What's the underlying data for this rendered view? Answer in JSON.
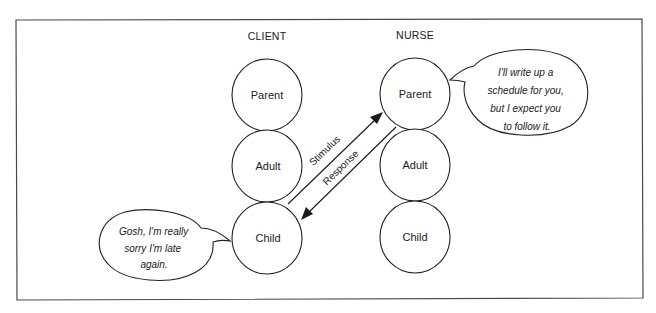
{
  "diagram": {
    "type": "transactional-analysis",
    "columns": [
      {
        "id": "client",
        "title": "CLIENT",
        "states": [
          {
            "label": "Parent"
          },
          {
            "label": "Adult"
          },
          {
            "label": "Child"
          }
        ]
      },
      {
        "id": "nurse",
        "title": "NURSE",
        "states": [
          {
            "label": "Parent"
          },
          {
            "label": "Adult"
          },
          {
            "label": "Child"
          }
        ]
      }
    ],
    "transactions": [
      {
        "label": "Stimulus",
        "from": "client.Child",
        "to": "nurse.Parent"
      },
      {
        "label": "Response",
        "from": "nurse.Parent",
        "to": "client.Child"
      }
    ],
    "bubbles": {
      "client": {
        "speaker": "client",
        "attached_to": "Child",
        "lines": [
          "Gosh, I'm really",
          "sorry I'm late",
          "again."
        ]
      },
      "nurse": {
        "speaker": "nurse",
        "attached_to": "Parent",
        "lines": [
          "I'll write up a",
          "schedule for you,",
          "but I expect you",
          "to follow it."
        ]
      }
    }
  }
}
